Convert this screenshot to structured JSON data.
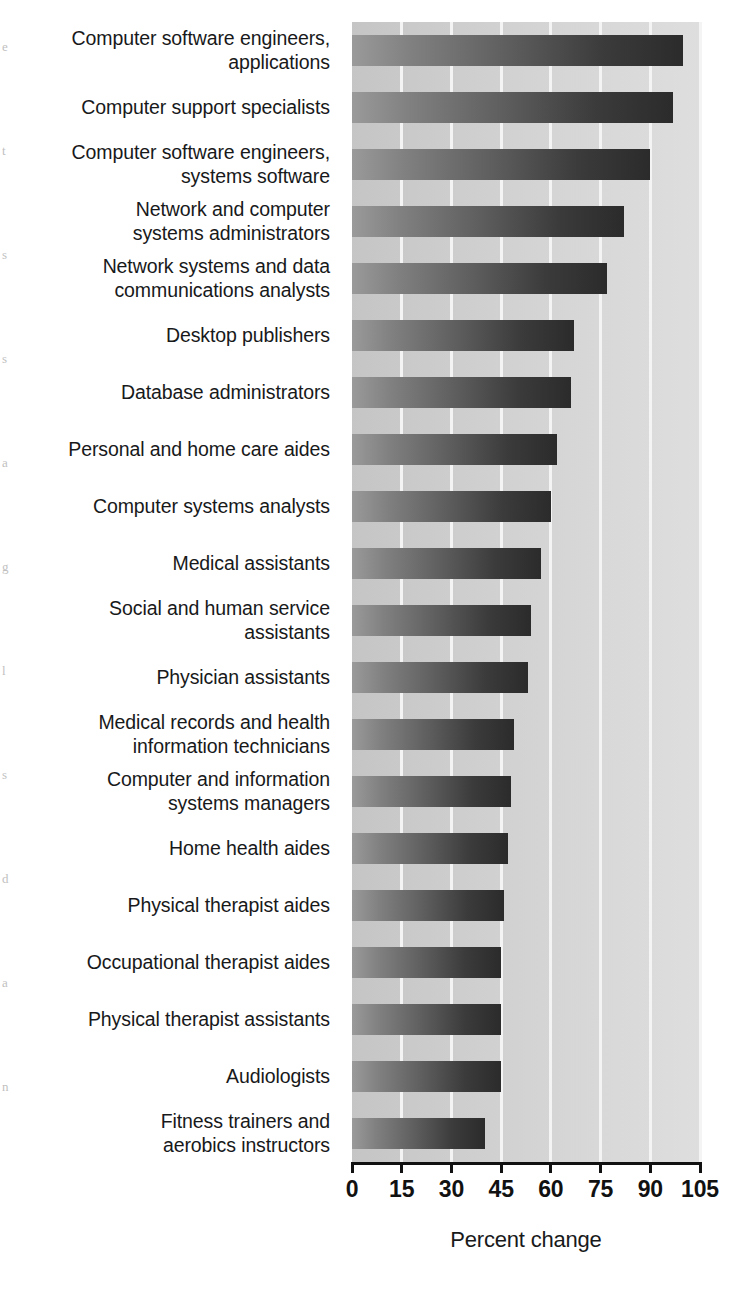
{
  "chart_data": {
    "type": "bar",
    "orientation": "horizontal",
    "title": "",
    "xlabel": "Percent change",
    "ylabel": "",
    "xlim": [
      0,
      105
    ],
    "xticks": [
      0,
      15,
      30,
      45,
      60,
      75,
      90,
      105
    ],
    "xtick_labels": [
      "0",
      "15",
      "30",
      "45",
      "60",
      "75",
      "90",
      "105"
    ],
    "grid": true,
    "grid_axis": "x",
    "legend": "none",
    "categories": [
      "Computer software engineers,\napplications",
      "Computer support specialists",
      "Computer software engineers,\nsystems software",
      "Network and computer\nsystems administrators",
      "Network systems and data\ncommunications analysts",
      "Desktop publishers",
      "Database administrators",
      "Personal and home care aides",
      "Computer systems analysts",
      "Medical assistants",
      "Social and human service\nassistants",
      "Physician assistants",
      "Medical records and health\ninformation technicians",
      "Computer and information\nsystems managers",
      "Home health aides",
      "Physical therapist aides",
      "Occupational therapist aides",
      "Physical therapist assistants",
      "Audiologists",
      "Fitness trainers and\naerobics instructors"
    ],
    "values": [
      100,
      97,
      90,
      82,
      77,
      67,
      66,
      62,
      60,
      57,
      54,
      53,
      49,
      48,
      47,
      46,
      45,
      45,
      45,
      40
    ],
    "bar_color_light": "#9a9a9a",
    "bar_color_dark": "#2b2b2b",
    "plot_background_light": "#dedede",
    "plot_background_dark": "#c5c5c5",
    "gridline_color": "#f4f4f4",
    "axis_color": "#111111"
  },
  "axis": {
    "title": "Percent change"
  },
  "edge_artifacts": [
    "e",
    "t",
    "s",
    "s",
    "a",
    "g",
    "l",
    "s",
    "d",
    "a",
    "n"
  ]
}
